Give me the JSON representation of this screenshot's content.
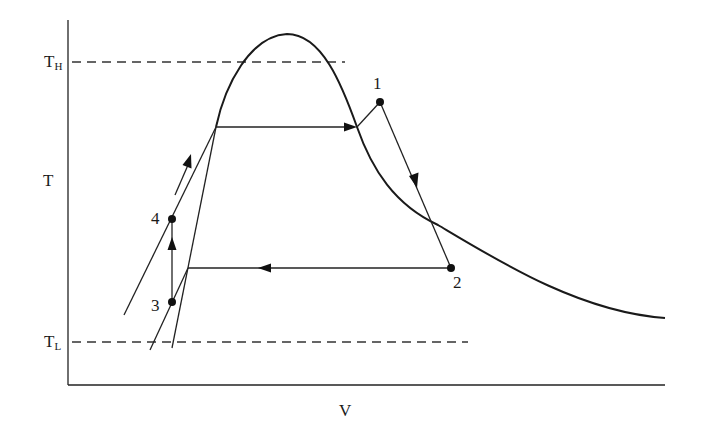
{
  "diagram": {
    "type": "thermodynamic T-V diagram",
    "axes": {
      "x_label": "V",
      "y_label": "T"
    },
    "reference_lines": {
      "high_temp": {
        "label": "T",
        "subscript": "H"
      },
      "low_temp": {
        "label": "T",
        "subscript": "L"
      }
    },
    "points": [
      {
        "id": "1",
        "label": "1"
      },
      {
        "id": "2",
        "label": "2"
      },
      {
        "id": "3",
        "label": "3"
      },
      {
        "id": "4",
        "label": "4"
      }
    ],
    "processes": [
      {
        "from": "4",
        "to": "1",
        "description": "heating along left line up to saturated-liquid curve, horizontal evaporation, then superheat to 1"
      },
      {
        "from": "1",
        "to": "2",
        "description": "expansion, downward"
      },
      {
        "from": "2",
        "to": "3",
        "description": "horizontal condensation to the left, then down to 3"
      },
      {
        "from": "3",
        "to": "4",
        "description": "vertical pumping up"
      }
    ],
    "curves": [
      "saturation dome",
      "right-side decaying curve"
    ]
  }
}
